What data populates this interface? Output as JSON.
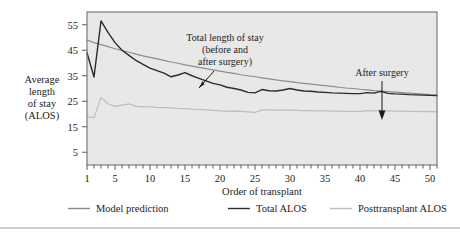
{
  "figure": {
    "background_color": "#ffffff",
    "plot_background_color": "#e8e8e8",
    "frame_color": "#6f6f6f"
  },
  "axis": {
    "y_label_lines": [
      "Average",
      "length",
      "of stay",
      "(ALOS)"
    ],
    "x_label": "Order of transplant",
    "y_ticks": [
      5,
      15,
      25,
      35,
      45,
      55
    ],
    "x_ticks": [
      1,
      5,
      10,
      15,
      20,
      25,
      30,
      35,
      40,
      45,
      50
    ]
  },
  "annotations": [
    {
      "name": "total-length-of-stay",
      "lines": [
        "Total length of stay",
        "(before and",
        "after surgery)"
      ],
      "x": 225,
      "y": 38
    },
    {
      "name": "after-surgery",
      "lines": [
        "After surgery"
      ],
      "x": 380,
      "y": 76
    }
  ],
  "legend": {
    "position": "bottom",
    "items": [
      {
        "label": "Model prediction",
        "color": "#8c8c8c"
      },
      {
        "label": "Total ALOS",
        "color": "#2b2b2b"
      },
      {
        "label": "Posttransplant ALOS",
        "color": "#bdbdbd"
      }
    ]
  },
  "chart_data": {
    "type": "line",
    "title": "",
    "xlabel": "Order of transplant",
    "ylabel": "Average length of stay (ALOS)",
    "xlim": [
      1,
      51
    ],
    "ylim": [
      0,
      60
    ],
    "grid": false,
    "legend_position": "bottom",
    "x": [
      1,
      2,
      3,
      4,
      5,
      6,
      7,
      8,
      9,
      10,
      11,
      12,
      13,
      14,
      15,
      16,
      17,
      18,
      19,
      20,
      21,
      22,
      23,
      24,
      25,
      26,
      27,
      28,
      29,
      30,
      31,
      32,
      33,
      34,
      35,
      36,
      37,
      38,
      39,
      40,
      41,
      42,
      43,
      44,
      45,
      46,
      47,
      48,
      49,
      50,
      51
    ],
    "series": [
      {
        "name": "Model prediction",
        "color": "#8c8c8c",
        "width": 1.2,
        "values": [
          49.0,
          48.0,
          47.2,
          46.4,
          45.6,
          44.9,
          44.2,
          43.5,
          42.8,
          42.2,
          41.6,
          41.0,
          40.4,
          39.9,
          39.3,
          38.8,
          38.3,
          37.8,
          37.3,
          36.8,
          36.3,
          35.9,
          35.4,
          35.0,
          34.6,
          34.2,
          33.8,
          33.4,
          33.0,
          32.7,
          32.3,
          32.0,
          31.7,
          31.4,
          31.1,
          30.8,
          30.5,
          30.2,
          30.0,
          29.7,
          29.5,
          29.2,
          29.0,
          28.8,
          28.6,
          28.4,
          28.2,
          28.0,
          27.8,
          27.6,
          27.5
        ]
      },
      {
        "name": "Total ALOS",
        "color": "#2b2b2b",
        "width": 1.4,
        "values": [
          44.0,
          34.5,
          56.5,
          52.0,
          48.0,
          45.0,
          43.0,
          41.0,
          39.5,
          38.0,
          37.0,
          36.0,
          34.6,
          35.3,
          36.2,
          35.0,
          34.0,
          33.0,
          32.0,
          31.4,
          30.5,
          30.0,
          29.4,
          28.5,
          28.3,
          29.6,
          29.1,
          29.0,
          29.4,
          30.0,
          29.4,
          29.0,
          28.9,
          28.6,
          28.5,
          28.3,
          28.2,
          28.1,
          28.0,
          28.0,
          28.4,
          28.2,
          28.9,
          28.1,
          27.9,
          27.8,
          27.6,
          27.5,
          27.4,
          27.3,
          27.2
        ]
      },
      {
        "name": "Posttransplant ALOS",
        "color": "#bdbdbd",
        "width": 1.2,
        "values": [
          19.0,
          18.5,
          26.5,
          24.0,
          23.0,
          23.5,
          24.0,
          23.0,
          22.8,
          22.8,
          22.6,
          22.5,
          22.4,
          22.2,
          22.1,
          21.9,
          21.8,
          21.6,
          21.4,
          21.2,
          21.0,
          21.1,
          21.0,
          20.8,
          20.6,
          21.6,
          21.6,
          21.5,
          21.5,
          21.5,
          21.4,
          21.3,
          21.3,
          21.2,
          21.2,
          21.1,
          21.1,
          21.0,
          21.0,
          21.0,
          21.3,
          21.2,
          21.4,
          21.2,
          21.1,
          21.1,
          21.0,
          21.0,
          20.9,
          20.9,
          20.8
        ]
      }
    ]
  }
}
